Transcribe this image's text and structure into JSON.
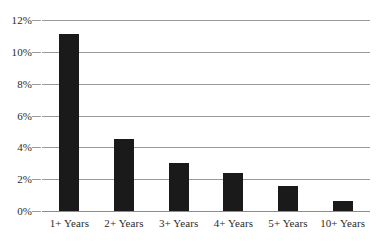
{
  "chart_data": {
    "type": "bar",
    "title": "",
    "subtitle": "",
    "xlabel": "",
    "ylabel": "",
    "categories": [
      "1+ Years",
      "2+ Years",
      "3+ Years",
      "4+ Years",
      "5+ Years",
      "10+ Years"
    ],
    "values": [
      11.1,
      4.5,
      3.0,
      2.4,
      1.6,
      0.6
    ],
    "value_unit": "%",
    "ylim": [
      0,
      12
    ],
    "ytick_values": [
      12,
      10,
      8,
      6,
      4,
      2,
      0
    ],
    "ytick_labels": [
      "12%",
      "10%",
      "8%",
      "6%",
      "4%",
      "2%",
      "0%"
    ],
    "grid": true,
    "grid_axis": "y",
    "legend": false,
    "legend_position": "none",
    "series": [
      {
        "name": "",
        "values": [
          11.1,
          4.5,
          3.0,
          2.4,
          1.6,
          0.6
        ]
      }
    ]
  },
  "style": {
    "bar_color": "#1a1a1a",
    "gridline_color": "#9a9a9a",
    "baseline_color": "#8c8c8c",
    "text_color": "#2b2b2b",
    "background_color": "#ffffff"
  }
}
